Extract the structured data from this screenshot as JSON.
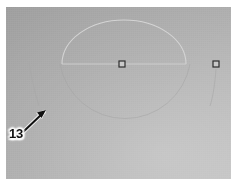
{
  "figure": {
    "kind": "grayscale-photograph-with-annotation",
    "width_px": 237,
    "height_px": 186,
    "background_color": "#ffffff",
    "plate": {
      "left_px": 6,
      "top_px": 7,
      "width_px": 225,
      "height_px": 172,
      "tone_light": "#c2c2c2",
      "tone_mid": "#b3b3b3",
      "tone_dark": "#a8a8a8",
      "gradient_direction": "top-left dark to bottom-right light"
    }
  },
  "annotations": {
    "callout": {
      "label": "13",
      "text_color": "#111111",
      "halo_color": "#ffffff",
      "x_px": 9,
      "y_px": 127
    },
    "leader_arrow": {
      "name": "leader-arrow",
      "color": "#111111",
      "from_x": 22,
      "from_y": 133,
      "to_x": 45,
      "to_y": 111,
      "head_length_px": 9,
      "direction": "up-right"
    }
  },
  "features": {
    "dome_arc": {
      "name": "dome-arc",
      "description": "bright semicircular arc above the chord",
      "left_x": 62,
      "right_x": 186,
      "apex_y": 20,
      "base_y": 64,
      "stroke_color": "#d4d4d4",
      "stroke_width": 1
    },
    "chord_line": {
      "name": "chord-line",
      "description": "horizontal bright line joining the arc ends",
      "x1": 62,
      "y1": 64,
      "x2": 186,
      "y2": 64,
      "stroke_color": "#cfcfcf",
      "stroke_width": 1
    },
    "lower_arc": {
      "name": "lower-arc",
      "description": "faint arc completing the circle below the chord",
      "left_x": 60,
      "right_x": 190,
      "bottom_y": 152,
      "stroke_color": "#a2a2a2",
      "stroke_width": 1
    },
    "left_trace": {
      "name": "left-trace-line",
      "description": "faint near-vertical trace on the left that the arrow indicates",
      "x_top": 29,
      "y_top": 62,
      "x_bottom": 38,
      "y_bottom": 105,
      "stroke_color": "#a5a5a5",
      "stroke_width": 1
    },
    "right_trace": {
      "name": "right-trace-line",
      "description": "faint near-vertical trace descending from the right marker",
      "x_top": 216,
      "y_top": 68,
      "x_bottom": 211,
      "y_bottom": 105,
      "stroke_color": "#a5a5a5",
      "stroke_width": 1
    }
  },
  "markers": [
    {
      "name": "center-square-marker",
      "shape": "square",
      "x_px": 122,
      "y_px": 64,
      "size_px": 6,
      "stroke_color": "#2e2e2e",
      "fill_color": "#c9c9c9"
    },
    {
      "name": "right-square-marker",
      "shape": "square",
      "x_px": 216,
      "y_px": 64,
      "size_px": 6,
      "stroke_color": "#2e2e2e",
      "fill_color": "#c9c9c9"
    }
  ]
}
